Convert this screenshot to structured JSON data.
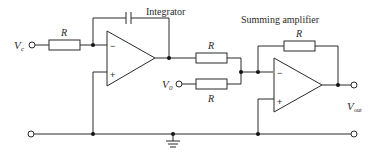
{
  "diagram": {
    "type": "circuit-schematic",
    "labels": {
      "integrator": "Integrator",
      "summing_amplifier": "Summing amplifier"
    },
    "inputs": {
      "vc": {
        "symbol": "V",
        "subscript": "c"
      },
      "v0": {
        "symbol": "V",
        "subscript": "0"
      }
    },
    "output": {
      "symbol": "V",
      "subscript": "out"
    },
    "components": {
      "r_input": "R",
      "r_sum_top": "R",
      "r_sum_bottom": "R",
      "r_feedback": "R"
    },
    "opamp_signs": {
      "inverting": "−",
      "noninverting": "+"
    }
  }
}
